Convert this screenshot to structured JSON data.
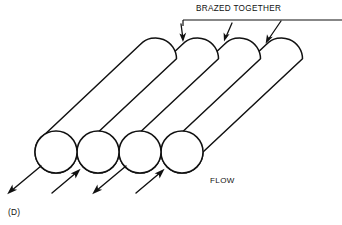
{
  "figure": {
    "id_label": "(D)",
    "callout_label": "BRAZED TOGETHER",
    "flow_label": "FLOW",
    "stroke_color": "#111111",
    "background_color": "#ffffff",
    "tube_count": 4
  },
  "tube_ends": [
    {
      "name": "tube-end-1",
      "cx": 56,
      "cy": 152,
      "r": 21
    },
    {
      "name": "tube-end-2",
      "cx": 98,
      "cy": 152,
      "r": 21
    },
    {
      "name": "tube-end-3",
      "cx": 140,
      "cy": 152,
      "r": 21
    },
    {
      "name": "tube-end-4",
      "cx": 182,
      "cy": 152,
      "r": 21
    }
  ],
  "braze_arrows": [
    {
      "name": "braze-arrow-1",
      "target_x": 183,
      "target_y": 40
    },
    {
      "name": "braze-arrow-2",
      "target_x": 225,
      "target_y": 40
    },
    {
      "name": "braze-arrow-3",
      "target_x": 266,
      "target_y": 44
    }
  ],
  "flow_arrows": [
    {
      "name": "flow-arrow-1",
      "direction": "out",
      "tip_x": 8,
      "tip_y": 193
    },
    {
      "name": "flow-arrow-2",
      "direction": "in",
      "tip_x": 80,
      "tip_y": 169
    },
    {
      "name": "flow-arrow-3",
      "direction": "out",
      "tip_x": 93,
      "tip_y": 193
    },
    {
      "name": "flow-arrow-4",
      "direction": "in",
      "tip_x": 164,
      "tip_y": 169
    }
  ],
  "leader": {
    "horizontal_y": 20,
    "left_x": 183,
    "right_x": 342
  }
}
